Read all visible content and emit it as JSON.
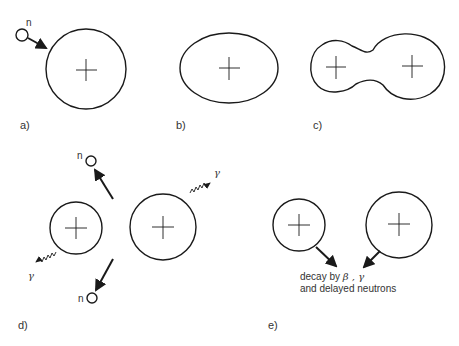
{
  "diagram": {
    "panels": [
      {
        "id": "a",
        "label": "a)",
        "description": "neutron approaching nucleus",
        "neutron_label": "n"
      },
      {
        "id": "b",
        "label": "b)",
        "description": "deformed (ellipsoidal) nucleus"
      },
      {
        "id": "c",
        "label": "c)",
        "description": "dumbbell-shaped nucleus before scission"
      },
      {
        "id": "d",
        "label": "d)",
        "description": "fission fragments emit neutrons and gamma rays",
        "neutron_labels": [
          "n",
          "n"
        ],
        "gamma_labels": [
          "γ",
          "γ"
        ]
      },
      {
        "id": "e",
        "label": "e)",
        "description": "fragments decay",
        "caption_line1": "decay by ",
        "caption_greek": "β , γ",
        "caption_line2": "and delayed neutrons"
      }
    ],
    "colors": {
      "stroke": "#1a1a1a",
      "background": "#ffffff",
      "text": "#333333"
    }
  }
}
